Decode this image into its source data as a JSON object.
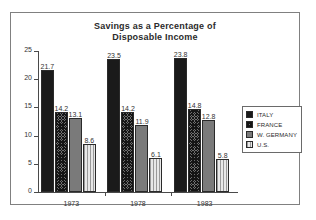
{
  "chart_data": {
    "type": "bar",
    "title": "Savings as a Percentage of Disposable Income",
    "title_lines": [
      "Savings as a Percentage of",
      "Disposable Income"
    ],
    "xlabel": "",
    "ylabel": "",
    "ylim": [
      0,
      25
    ],
    "yticks": [
      0,
      5,
      10,
      15,
      20,
      25
    ],
    "ytick_labels": [
      "0",
      "5",
      "10",
      "15",
      "20",
      "25"
    ],
    "grid": false,
    "legend_position": "right",
    "categories": [
      "1973",
      "1978",
      "1983"
    ],
    "series": [
      {
        "name": "ITALY",
        "pattern": "solid-black",
        "color": "#1a1a1a",
        "values": [
          21.7,
          23.5,
          23.8
        ],
        "labels": [
          "21.7",
          "23.5",
          "23.8"
        ]
      },
      {
        "name": "FRANCE",
        "pattern": "cross-hatch",
        "color": "#6e6e6e",
        "values": [
          14.2,
          14.2,
          14.8
        ],
        "labels": [
          "14.2",
          "14.2",
          "14.8"
        ]
      },
      {
        "name": "W. GERMANY",
        "pattern": "solid-gray",
        "color": "#7a7a7a",
        "values": [
          13.1,
          11.9,
          12.8
        ],
        "labels": [
          "13.1",
          "11.9",
          "12.8"
        ]
      },
      {
        "name": "U.S.",
        "pattern": "vertical-lines",
        "color": "#e8e8e8",
        "values": [
          8.6,
          6.1,
          5.8
        ],
        "labels": [
          "8.6",
          "6.1",
          "5.8"
        ]
      }
    ]
  },
  "legend": {
    "items": [
      {
        "label": "ITALY"
      },
      {
        "label": "FRANCE"
      },
      {
        "label": "W. GERMANY"
      },
      {
        "label": "U.S."
      }
    ]
  }
}
